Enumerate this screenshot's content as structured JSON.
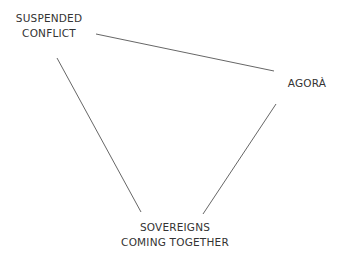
{
  "diagram": {
    "type": "triangle",
    "nodes": [
      {
        "id": "suspended-conflict",
        "lines": [
          "SUSPENDED",
          "CONFLICT"
        ]
      },
      {
        "id": "agora",
        "lines": [
          "AGORÀ"
        ]
      },
      {
        "id": "sovereigns-coming-together",
        "lines": [
          "SOVEREIGNS",
          "COMING TOGETHER"
        ]
      }
    ],
    "edges": [
      {
        "from": "suspended-conflict",
        "to": "agora"
      },
      {
        "from": "suspended-conflict",
        "to": "sovereigns-coming-together"
      },
      {
        "from": "agora",
        "to": "sovereigns-coming-together"
      }
    ],
    "colors": {
      "line": "#555555",
      "text": "#333333",
      "background": "#ffffff"
    }
  }
}
